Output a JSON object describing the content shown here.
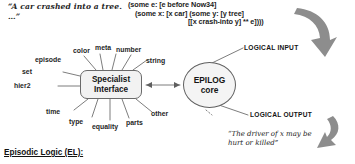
{
  "figure": {
    "nl_input_quote": "“A car crashed into a tree. …”",
    "el_form": {
      "line1": "(some e: [e before Now34]",
      "line2": "(some x: [x car] (some y: [y tree]",
      "line3": "[[x crash-into y] ** e])))"
    },
    "nl_output_quote": "“The driver of x may be hurt or killed”",
    "caption": "Episodic Logic (EL):"
  },
  "nodes": {
    "specialist_interface": {
      "line1": "Specialist",
      "line2": "Interface"
    },
    "epilog_core": {
      "line1": "EPILOG",
      "line2": "core"
    }
  },
  "specialists": [
    {
      "label": "color"
    },
    {
      "label": "meta"
    },
    {
      "label": "number"
    },
    {
      "label": "string"
    },
    {
      "label": "episode"
    },
    {
      "label": "set"
    },
    {
      "label": "hier2"
    },
    {
      "label": "time"
    },
    {
      "label": "type"
    },
    {
      "label": "equality"
    },
    {
      "label": "parts"
    },
    {
      "label": "other"
    }
  ],
  "io": {
    "input_label": "LOGICAL INPUT",
    "output_label": "LOGICAL OUTPUT"
  },
  "colors": {
    "ink": "#1a1a1a",
    "stroke": "#6a6a6a",
    "fill": "#f2f2f2",
    "background": "#ffffff"
  }
}
